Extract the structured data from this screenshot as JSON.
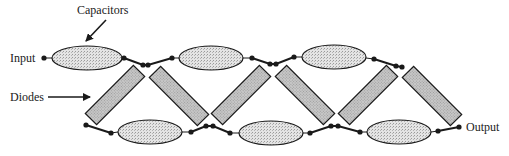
{
  "diagram": {
    "labels": {
      "capacitors": "Capacitors",
      "diodes": "Diodes",
      "input": "Input",
      "output": "Output"
    },
    "components": {
      "top_capacitors": 3,
      "bottom_capacitors": 3,
      "diodes": 6
    },
    "colors": {
      "line": "#1a1a1a",
      "capacitor_fill": "#d9d9d9",
      "diode_fill": "#bdbdbd",
      "background": "#ffffff"
    }
  }
}
